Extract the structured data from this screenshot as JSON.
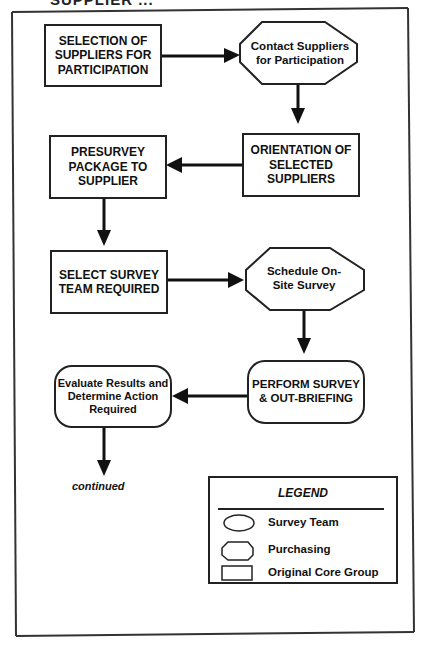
{
  "header": {
    "title": "SUPPLIER ..."
  },
  "nodes": {
    "selection": {
      "label": "SELECTION OF SUPPLIERS FOR PARTICIPATION",
      "shape": "rectangle",
      "owner": "Original Core Group"
    },
    "contact": {
      "label": "Contact Suppliers for Participation",
      "shape": "octagon",
      "owner": "Purchasing"
    },
    "orientation": {
      "label": "ORIENTATION OF SELECTED SUPPLIERS",
      "shape": "rectangle",
      "owner": "Original Core Group"
    },
    "presurvey": {
      "label": "PRESURVEY PACKAGE TO SUPPLIER",
      "shape": "rectangle",
      "owner": "Original Core Group"
    },
    "select_team": {
      "label": "SELECT SURVEY TEAM REQUIRED",
      "shape": "rectangle",
      "owner": "Original Core Group"
    },
    "schedule": {
      "label": "Schedule On-Site Survey",
      "shape": "octagon",
      "owner": "Purchasing"
    },
    "perform": {
      "label": "PERFORM SURVEY & OUT-BRIEFING",
      "shape": "rounded",
      "owner": "Survey Team"
    },
    "evaluate": {
      "label": "Evaluate Results and Determine Action Required",
      "shape": "rounded",
      "owner": "Survey Team"
    }
  },
  "continued_label": "continued",
  "legend": {
    "title": "LEGEND",
    "items": [
      {
        "shape": "ellipse",
        "label": "Survey Team"
      },
      {
        "shape": "octagon",
        "label": "Purchasing"
      },
      {
        "shape": "rectangle",
        "label": "Original Core Group"
      }
    ]
  },
  "flow": [
    [
      "selection",
      "contact"
    ],
    [
      "contact",
      "orientation"
    ],
    [
      "orientation",
      "presurvey"
    ],
    [
      "presurvey",
      "select_team"
    ],
    [
      "select_team",
      "schedule"
    ],
    [
      "schedule",
      "perform"
    ],
    [
      "perform",
      "evaluate"
    ],
    [
      "evaluate",
      "continued"
    ]
  ]
}
